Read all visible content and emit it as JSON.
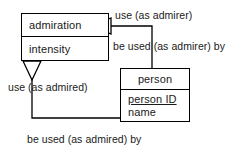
{
  "diagram": {
    "type": "uml-class-diagram",
    "stroke_color": "#000000",
    "text_color": "#1a1a1a",
    "background_color": "#ffffff",
    "classes": [
      {
        "id": "admiration",
        "name": "admiration",
        "attributes": [
          {
            "label": "intensity",
            "primary_key": false
          }
        ]
      },
      {
        "id": "person",
        "name": "person",
        "attributes": [
          {
            "label": "person ID",
            "primary_key": true
          },
          {
            "label": "name",
            "primary_key": false
          }
        ]
      }
    ],
    "relationships": [
      {
        "id": "admirer-forward",
        "label": "use (as admirer)",
        "from": "admiration",
        "to": "person",
        "arrow": "hollow-triangle",
        "direction": "left"
      },
      {
        "id": "admirer-inverse",
        "label": "be used (as admirer) by",
        "from": "person",
        "to": "admiration",
        "arrow": "none"
      },
      {
        "id": "admired-forward",
        "label": "use (as admired)",
        "from": "admiration",
        "to": "person",
        "arrow": "hollow-triangle",
        "direction": "down"
      },
      {
        "id": "admired-inverse",
        "label": "be used (as admired) by",
        "from": "person",
        "to": "admiration",
        "arrow": "none"
      }
    ]
  }
}
